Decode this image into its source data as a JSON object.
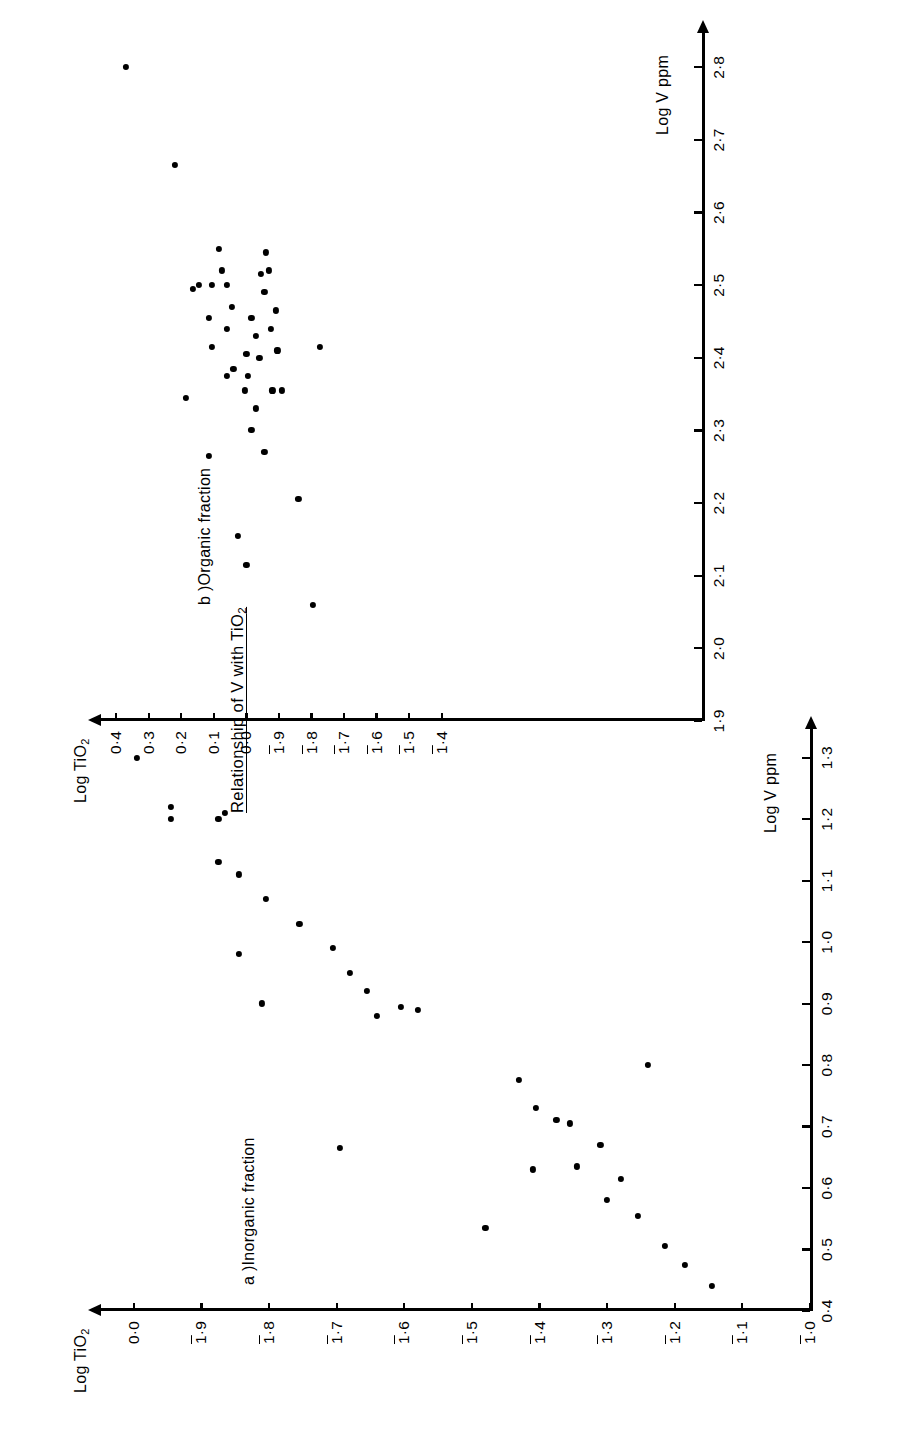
{
  "figure": {
    "title": "Relationship of V with TiO",
    "title_subscript": "2",
    "orientation": "rotated-90-ccw"
  },
  "chart_data": [
    {
      "type": "scatter",
      "panel_id": "a",
      "panel_label": "a )Inorganic fraction",
      "title": "a )Inorganic fraction",
      "xlabel": "Log V ppm",
      "ylabel": "Log TiO",
      "ylabel_subscript": "2",
      "xlim": [
        0.4,
        1.35
      ],
      "ylim": [
        -1.0,
        0.05
      ],
      "grid": false,
      "legend": "none",
      "xticks": [
        "0·4",
        "0·5",
        "0·6",
        "0·7",
        "0·8",
        "0·9",
        "1·0",
        "1·1",
        "1·2",
        "1·3"
      ],
      "xtick_values": [
        0.4,
        0.5,
        0.6,
        0.7,
        0.8,
        0.9,
        1.0,
        1.1,
        1.2,
        1.3
      ],
      "yticks": [
        "0·0",
        "1̄·9",
        "1̄·8",
        "1̄·7",
        "1̄·6",
        "1̄·5",
        "1̄·4",
        "1̄·3",
        "1̄·2",
        "1̄·1",
        "1̄·0"
      ],
      "yticks_plain": [
        "0.0",
        "1.9",
        "1.8",
        "1.7",
        "1.6",
        "1.5",
        "1.4",
        "1.3",
        "1.2",
        "1.1",
        "1.0"
      ],
      "ytick_values": [
        0.0,
        -0.1,
        -0.2,
        -0.3,
        -0.4,
        -0.5,
        -0.6,
        -0.7,
        -0.8,
        -0.9,
        -1.0
      ],
      "ytick_note": "Bar over leading 1 denotes negative mantissa notation; 1̄·9 = -0.1 etc.",
      "points": [
        [
          1.3,
          -0.005
        ],
        [
          1.22,
          -0.055
        ],
        [
          1.2,
          -0.055
        ],
        [
          1.2,
          -0.125
        ],
        [
          1.21,
          -0.135
        ],
        [
          1.13,
          -0.125
        ],
        [
          1.11,
          -0.155
        ],
        [
          1.07,
          -0.195
        ],
        [
          1.03,
          -0.245
        ],
        [
          0.99,
          -0.295
        ],
        [
          0.98,
          -0.155
        ],
        [
          0.95,
          -0.32
        ],
        [
          0.92,
          -0.345
        ],
        [
          0.9,
          -0.19
        ],
        [
          0.895,
          -0.395
        ],
        [
          0.89,
          -0.42
        ],
        [
          0.88,
          -0.36
        ],
        [
          0.665,
          -0.305
        ],
        [
          0.73,
          -0.595
        ],
        [
          0.71,
          -0.625
        ],
        [
          0.705,
          -0.645
        ],
        [
          0.67,
          -0.69
        ],
        [
          0.635,
          -0.655
        ],
        [
          0.63,
          -0.59
        ],
        [
          0.615,
          -0.72
        ],
        [
          0.58,
          -0.7
        ],
        [
          0.555,
          -0.745
        ],
        [
          0.535,
          -0.52
        ],
        [
          0.505,
          -0.785
        ],
        [
          0.475,
          -0.815
        ],
        [
          0.44,
          -0.855
        ],
        [
          0.775,
          -0.57
        ],
        [
          0.8,
          -0.76
        ]
      ]
    },
    {
      "type": "scatter",
      "panel_id": "b",
      "panel_label": "b )Organic  fraction",
      "title": "b )Organic  fraction",
      "xlabel": "Log V ppm",
      "ylabel": "Log TiO",
      "ylabel_subscript": "2",
      "xlim": [
        1.9,
        2.85
      ],
      "ylim": [
        -1.4,
        0.45
      ],
      "grid": false,
      "legend": "none",
      "xticks": [
        "1·9",
        "2·0",
        "2·1",
        "2·2",
        "2·3",
        "2·4",
        "2·5",
        "2·6",
        "2·7",
        "2·8"
      ],
      "xtick_values": [
        1.9,
        2.0,
        2.1,
        2.2,
        2.3,
        2.4,
        2.5,
        2.6,
        2.7,
        2.8
      ],
      "yticks": [
        "0·4",
        "0·3",
        "0·2",
        "0·1",
        "0·0",
        "1̄·9",
        "1̄·8",
        "1̄·7",
        "1̄·6",
        "1̄·5",
        "1̄·4"
      ],
      "yticks_plain": [
        "0.4",
        "0.3",
        "0.2",
        "0.1",
        "0.0",
        "1.9",
        "1.8",
        "1.7",
        "1.6",
        "1.5",
        "1.4"
      ],
      "ytick_values": [
        0.4,
        0.3,
        0.2,
        0.1,
        0.0,
        -0.1,
        -0.2,
        -0.3,
        -0.4,
        -0.5,
        -0.6
      ],
      "ytick_note": "Bar over leading 1 denotes negative mantissa notation; 1̄·4 = -0.6 etc.",
      "points": [
        [
          2.8,
          0.37
        ],
        [
          2.665,
          0.22
        ],
        [
          2.495,
          0.165
        ],
        [
          2.5,
          0.145
        ],
        [
          2.455,
          0.115
        ],
        [
          2.415,
          0.105
        ],
        [
          2.55,
          0.085
        ],
        [
          2.52,
          0.075
        ],
        [
          2.5,
          0.06
        ],
        [
          2.47,
          0.045
        ],
        [
          2.44,
          0.06
        ],
        [
          2.385,
          0.04
        ],
        [
          2.345,
          0.185
        ],
        [
          2.355,
          0.005
        ],
        [
          2.405,
          0.0
        ],
        [
          2.375,
          -0.005
        ],
        [
          2.455,
          -0.015
        ],
        [
          2.43,
          -0.03
        ],
        [
          2.4,
          -0.04
        ],
        [
          2.515,
          -0.045
        ],
        [
          2.49,
          -0.055
        ],
        [
          2.545,
          -0.06
        ],
        [
          2.52,
          -0.07
        ],
        [
          2.44,
          -0.075
        ],
        [
          2.355,
          -0.08
        ],
        [
          2.33,
          -0.03
        ],
        [
          2.465,
          -0.09
        ],
        [
          2.41,
          -0.095
        ],
        [
          2.3,
          -0.015
        ],
        [
          2.265,
          0.115
        ],
        [
          2.27,
          -0.055
        ],
        [
          2.155,
          0.025
        ],
        [
          2.115,
          0.0
        ],
        [
          2.355,
          -0.11
        ],
        [
          2.205,
          -0.16
        ],
        [
          2.06,
          -0.205
        ],
        [
          2.415,
          -0.225
        ],
        [
          2.5,
          0.105
        ],
        [
          2.375,
          0.06
        ]
      ]
    }
  ]
}
